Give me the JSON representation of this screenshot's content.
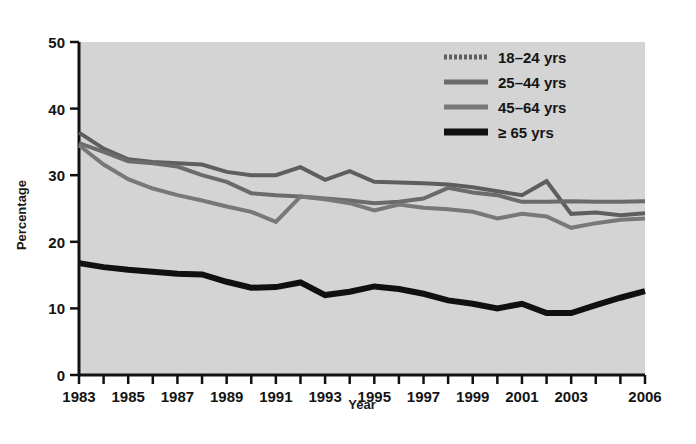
{
  "chart_data": {
    "type": "line",
    "title": "",
    "xlabel": "Year",
    "ylabel": "Percentage",
    "xlim": [
      1983,
      2006
    ],
    "ylim": [
      0,
      50
    ],
    "ytick_values": [
      0,
      10,
      20,
      30,
      40,
      50
    ],
    "ytick_labels": [
      "0",
      "10",
      "20",
      "30",
      "40",
      "50"
    ],
    "xtick_labels": [
      "1983",
      "1985",
      "1987",
      "1989",
      "1991",
      "1993",
      "1995",
      "1997",
      "1999",
      "2001",
      "2003",
      "2006"
    ],
    "xtick_values": [
      1983,
      1985,
      1987,
      1989,
      1991,
      1993,
      1995,
      1997,
      1999,
      2001,
      2003,
      2006
    ],
    "minor_xticks_every": 1,
    "grid": false,
    "legend_position": "top-right",
    "plot_background": "#d4d4d4",
    "x": [
      1983,
      1984,
      1985,
      1986,
      1987,
      1988,
      1989,
      1990,
      1991,
      1992,
      1993,
      1994,
      1995,
      1996,
      1997,
      1998,
      1999,
      2000,
      2001,
      2002,
      2003,
      2004,
      2005,
      2006
    ],
    "series": [
      {
        "name": "18–24 yrs",
        "color": "#5e5e5e",
        "width": 4,
        "values": [
          36.4,
          34.0,
          32.4,
          32.0,
          31.8,
          31.6,
          30.5,
          30.0,
          30.0,
          31.2,
          29.3,
          30.6,
          29.0,
          28.9,
          28.8,
          28.6,
          28.2,
          27.6,
          27.0,
          29.1,
          24.2,
          24.4,
          24.0,
          24.3
        ],
        "legend_swatch": "dotted-gray"
      },
      {
        "name": "25–44 yrs",
        "color": "#6b6b6b",
        "width": 4,
        "values": [
          34.8,
          33.5,
          32.1,
          31.8,
          31.3,
          30.0,
          29.0,
          27.3,
          27.0,
          26.8,
          26.5,
          26.2,
          25.8,
          26.0,
          26.5,
          28.1,
          27.4,
          27.0,
          26.0,
          26.0,
          26.1,
          26.0,
          26.0,
          26.1
        ],
        "legend_swatch": "solid-gray"
      },
      {
        "name": "45–64 yrs",
        "color": "#787878",
        "width": 4,
        "values": [
          34.5,
          31.6,
          29.4,
          28.0,
          27.0,
          26.2,
          25.3,
          24.5,
          23.0,
          26.8,
          26.4,
          25.8,
          24.7,
          25.6,
          25.1,
          24.9,
          24.5,
          23.5,
          24.2,
          23.8,
          22.1,
          22.8,
          23.3,
          23.5
        ],
        "legend_swatch": "solid-gray"
      },
      {
        "name": "≥ 65 yrs",
        "color": "#101010",
        "width": 6,
        "values": [
          16.8,
          16.2,
          15.8,
          15.5,
          15.2,
          15.1,
          14.0,
          13.1,
          13.2,
          13.9,
          12.0,
          12.5,
          13.3,
          12.9,
          12.2,
          11.2,
          10.7,
          10.0,
          10.7,
          9.3,
          9.3,
          10.5,
          11.6,
          12.6
        ]
      }
    ]
  },
  "legend": {
    "entries": [
      {
        "label": "18–24 yrs"
      },
      {
        "label": "25–44 yrs"
      },
      {
        "label": "45–64 yrs"
      },
      {
        "label": "≥ 65 yrs"
      }
    ]
  },
  "axes": {
    "x_title": "Year",
    "y_title": "Percentage"
  }
}
